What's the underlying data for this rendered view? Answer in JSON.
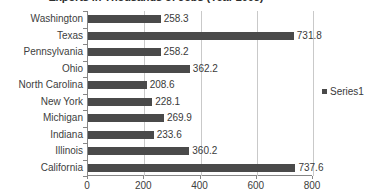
{
  "chart_data": {
    "type": "bar",
    "orientation": "horizontal",
    "title": "Exports in Thousands of Jobs (Year 2005)",
    "xlabel": "",
    "ylabel": "",
    "xlim": [
      0,
      800
    ],
    "xticks": [
      "0",
      "200",
      "400",
      "600",
      "800"
    ],
    "xtick_values": [
      0,
      200,
      400,
      600,
      800
    ],
    "grid": true,
    "grid_axis": "x",
    "legend_position": "right",
    "categories": [
      "Washington",
      "Texas",
      "Pennsylvania",
      "Ohio",
      "North Carolina",
      "New York",
      "Michigan",
      "Indiana",
      "Illinois",
      "California"
    ],
    "values": [
      258.3,
      731.8,
      258.2,
      362.2,
      208.6,
      228.1,
      269.9,
      233.6,
      360.2,
      737.6
    ],
    "data_labels": [
      "258.3",
      "731.8",
      "258.2",
      "362.2",
      "208.6",
      "228.1",
      "269.9",
      "233.6",
      "360.2",
      "737.6"
    ],
    "series": [
      {
        "name": "Series1",
        "color": "#4a4a4a",
        "values": [
          258.3,
          731.8,
          258.2,
          362.2,
          208.6,
          228.1,
          269.9,
          233.6,
          360.2,
          737.6
        ]
      }
    ]
  },
  "legend": {
    "entries": [
      {
        "label": "Series1",
        "color": "#4a4a4a"
      }
    ]
  },
  "colors": {
    "bar": "#4a4a4a",
    "gridline": "#c9c9c9",
    "axis": "#868686",
    "text": "#3c3c3c",
    "background": "#ffffff"
  }
}
